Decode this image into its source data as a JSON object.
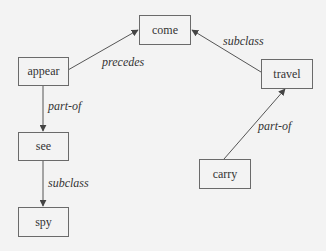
{
  "diagram": {
    "type": "concept-graph",
    "nodes": [
      {
        "id": "come",
        "label": "come"
      },
      {
        "id": "appear",
        "label": "appear"
      },
      {
        "id": "travel",
        "label": "travel"
      },
      {
        "id": "see",
        "label": "see"
      },
      {
        "id": "carry",
        "label": "carry"
      },
      {
        "id": "spy",
        "label": "spy"
      }
    ],
    "edges": [
      {
        "from": "appear",
        "to": "come",
        "label": "precedes"
      },
      {
        "from": "travel",
        "to": "come",
        "label": "subclass"
      },
      {
        "from": "appear",
        "to": "see",
        "label": "part-of"
      },
      {
        "from": "carry",
        "to": "travel",
        "label": "part-of"
      },
      {
        "from": "see",
        "to": "spy",
        "label": "subclass"
      }
    ]
  },
  "colors": {
    "background": "#f3f3f3",
    "stroke": "#6a6a6a",
    "text": "#333333"
  }
}
